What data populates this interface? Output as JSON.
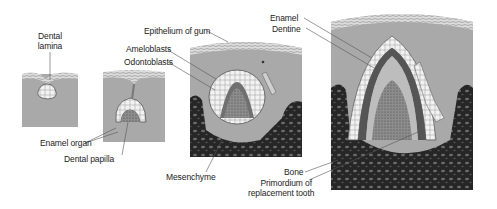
{
  "figure": {
    "colors": {
      "background": "#ffffff",
      "tissue": "#a9a9a9",
      "epithelium": "#d8d8d8",
      "bone": "#2a2a2a",
      "enamel": "#555555",
      "dentine": "#bdbdbd",
      "pulp": "#8a8a8a",
      "label_text": "#222222",
      "leader_line": "#555555"
    },
    "stages": [
      {
        "id": "stage-1",
        "name": "dental lamina stage"
      },
      {
        "id": "stage-2",
        "name": "cap stage"
      },
      {
        "id": "stage-3",
        "name": "bell stage"
      },
      {
        "id": "stage-4",
        "name": "crown formation"
      }
    ],
    "labels": {
      "dental_lamina_1": "Dental",
      "dental_lamina_2": "lamina",
      "enamel_organ": "Enamel organ",
      "dental_papilla": "Dental papilla",
      "epithelium_of_gum": "Epithelium of gum",
      "ameloblasts": "Ameloblasts",
      "odontoblasts": "Odontoblasts",
      "mesenchyme": "Mesenchyme",
      "enamel": "Enamel",
      "dentine": "Dentine",
      "bone": "Bone",
      "primordium_1": "Primordium of",
      "primordium_2": "replacement tooth"
    }
  }
}
